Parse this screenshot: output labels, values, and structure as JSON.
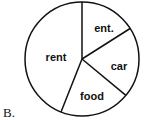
{
  "option_label": "B.",
  "chart_data": {
    "type": "pie",
    "title": "",
    "labels": [
      "ent.",
      "car",
      "food",
      "rent"
    ],
    "values": [
      16,
      20,
      20,
      44
    ],
    "start_angle_deg_from_top": 0,
    "direction": "clockwise",
    "colors": [
      "#ffffff",
      "#ffffff",
      "#ffffff",
      "#ffffff"
    ],
    "stroke": "#111111",
    "legend": "none, labels inside slices"
  }
}
